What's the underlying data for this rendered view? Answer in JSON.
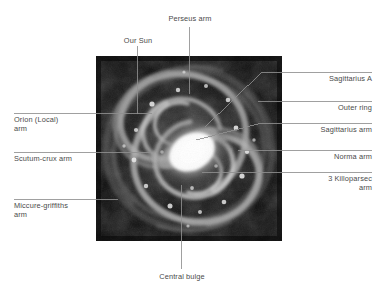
{
  "figure": {
    "kind": "annotated-diagram",
    "image": {
      "name": "spiral-galaxy-photograph",
      "style": "grayscale",
      "x": 96,
      "y": 56,
      "width": 186,
      "height": 185,
      "background_color": "#0a0a0a",
      "core_color": "#ffffff"
    },
    "colors": {
      "text": "#4a4a4a",
      "leader_line": "#8f8f8f",
      "page_background": "#ffffff"
    }
  },
  "labels": {
    "our_sun": "Our Sun",
    "perseus_arm": "Perseus arm",
    "sagittarius_a": "Sagittarius A",
    "outer_ring": "Outer ring",
    "sagittarius_arm": "Sagittarius arm",
    "norma_arm": "Norma arm",
    "three_killoparsec_arm": "3 Killoparsec\narm",
    "orion_local_arm": "Orion (Local)\narm",
    "scutum_crux_arm": "Scutum-crux arm",
    "miccure_griffiths_arm": "Miccure-griffiths\narm",
    "central_bulge": "Central bulge"
  }
}
